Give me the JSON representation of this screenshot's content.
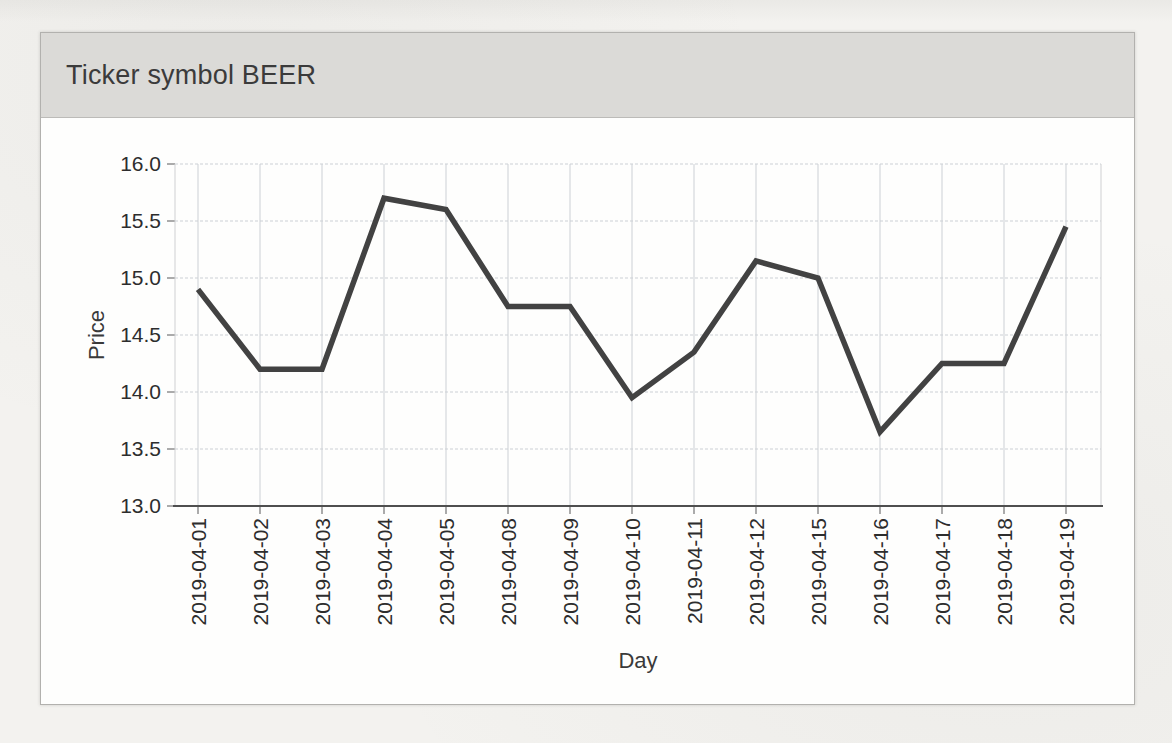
{
  "page": {
    "background": "#f3f2ef"
  },
  "panel": {
    "title": "Ticker symbol BEER",
    "colors": {
      "header_bg": "#dbdad7",
      "header_text": "#3b3b3b",
      "body_bg": "#fdfdfc",
      "border": "#b2b1ae"
    }
  },
  "chart_data": {
    "type": "line",
    "title": "Ticker symbol BEER",
    "xlabel": "Day",
    "ylabel": "Price",
    "categories": [
      "2019-04-01",
      "2019-04-02",
      "2019-04-03",
      "2019-04-04",
      "2019-04-05",
      "2019-04-08",
      "2019-04-09",
      "2019-04-10",
      "2019-04-11",
      "2019-04-12",
      "2019-04-15",
      "2019-04-16",
      "2019-04-17",
      "2019-04-18",
      "2019-04-19"
    ],
    "series": [
      {
        "name": "Price",
        "values": [
          14.9,
          14.2,
          14.2,
          15.7,
          15.6,
          14.75,
          14.75,
          13.95,
          14.35,
          15.15,
          15.0,
          13.65,
          14.25,
          14.25,
          15.45
        ]
      }
    ],
    "ylim": [
      13.0,
      16.0
    ],
    "yticks": [
      16.0,
      15.5,
      15.0,
      14.5,
      14.0,
      13.5,
      13.0
    ],
    "ytick_labels": [
      "16.0",
      "15.5",
      "15.0",
      "14.5",
      "14.0",
      "13.5",
      "13.0"
    ],
    "grid": true,
    "legend": false,
    "colors": {
      "line": "#424242",
      "grid": "#ccd0d5",
      "axis": "#4f4f4f",
      "tick_text": "#2d2d2d"
    }
  }
}
